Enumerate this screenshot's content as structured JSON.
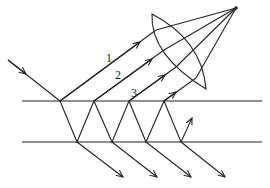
{
  "diagram": {
    "ray_labels": [
      "1",
      "2",
      "3"
    ],
    "colors": {
      "stroke": "#222222",
      "background": "#ffffff"
    },
    "elements": [
      "incident-ray",
      "plate-top-surface",
      "plate-bottom-surface",
      "reflected-rays",
      "transmitted-rays",
      "converging-lens",
      "focal-point"
    ]
  }
}
